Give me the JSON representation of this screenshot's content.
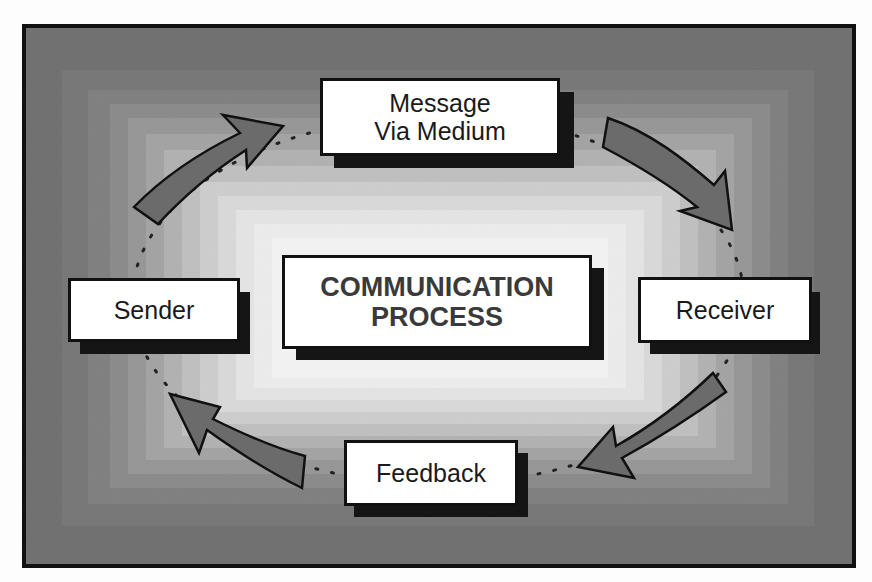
{
  "diagram": {
    "title_line1": "COMMUNICATION",
    "title_line2": "PROCESS",
    "nodes": [
      {
        "id": "message",
        "line1": "Message",
        "line2": "Via Medium"
      },
      {
        "id": "receiver",
        "label": "Receiver"
      },
      {
        "id": "feedback",
        "label": "Feedback"
      },
      {
        "id": "sender",
        "label": "Sender"
      }
    ],
    "flow": [
      "Sender",
      "Message Via Medium",
      "Receiver",
      "Feedback",
      "Sender"
    ],
    "colors": {
      "frame": "#111111",
      "background_outer": "#6f6f6f",
      "background_inner": "#f4f4f4",
      "arrow_fill": "#6b6b6b",
      "node_fill": "#ffffff",
      "shadow": "#151515",
      "title_text": "#3a3a3a"
    }
  }
}
